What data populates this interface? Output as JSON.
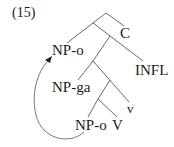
{
  "example_number": "(15)",
  "nodes": {
    "c": "C",
    "np_o_top": "NP-o",
    "infl": "INFL",
    "np_ga": "NP-ga",
    "v_small": "v",
    "np_o_bottom": "NP-o",
    "v_big": "V"
  },
  "colors": {
    "line": "#333333",
    "text": "#1a1a1a"
  }
}
